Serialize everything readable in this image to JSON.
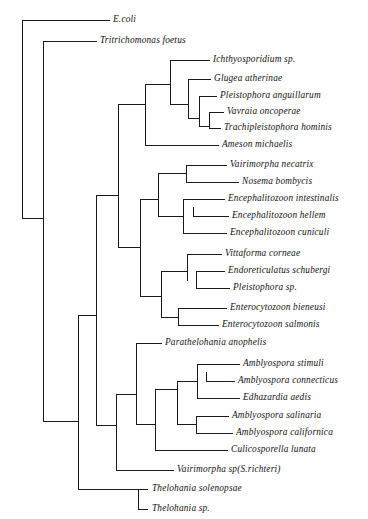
{
  "figure": {
    "kind": "phylogenetic-cladogram",
    "background_color": "#ffffff",
    "line_color": "#1a1a1a",
    "text_color": "#111111",
    "width": 368,
    "height": 519
  },
  "chart_data": {
    "type": "tree",
    "title": "",
    "xlabel": "",
    "ylabel": "",
    "leaf_count": 24,
    "leaves": [
      {
        "name": "E.coli",
        "x": 113,
        "y": 20
      },
      {
        "name": "Tritrichomonas foetus",
        "x": 100,
        "y": 41
      },
      {
        "name": "Ichthyosporidium sp.",
        "x": 213,
        "y": 60
      },
      {
        "name": "Glugea atherinae",
        "x": 214,
        "y": 79
      },
      {
        "name": "Pleistophora anguillarum",
        "x": 220,
        "y": 96
      },
      {
        "name": "Vavraia oncoperae",
        "x": 227,
        "y": 112
      },
      {
        "name": "Trachipleistophora hominis",
        "x": 224,
        "y": 128
      },
      {
        "name": "Ameson michaelis",
        "x": 222,
        "y": 145
      },
      {
        "name": "Vairimorpha necatrix",
        "x": 230,
        "y": 165
      },
      {
        "name": "Nosema bombycis",
        "x": 242,
        "y": 182
      },
      {
        "name": "Encephalitozoon intestinalis",
        "x": 228,
        "y": 199
      },
      {
        "name": "Encephalitozoon hellem",
        "x": 232,
        "y": 216
      },
      {
        "name": "Encephalitozoon cuniculi",
        "x": 230,
        "y": 233
      },
      {
        "name": "Vittaforma corneae",
        "x": 225,
        "y": 254
      },
      {
        "name": "Endoreticulatus schubergi",
        "x": 228,
        "y": 271
      },
      {
        "name": "Pleistophora sp.",
        "x": 233,
        "y": 288
      },
      {
        "name": "Enterocytozoon bieneusi",
        "x": 230,
        "y": 308
      },
      {
        "name": "Enterocytozoon salmonis",
        "x": 222,
        "y": 325
      },
      {
        "name": "Parathelohania anophelis",
        "x": 165,
        "y": 343
      },
      {
        "name": "Amblyospora stimuli",
        "x": 243,
        "y": 364
      },
      {
        "name": "Amblyospora connecticus",
        "x": 238,
        "y": 381
      },
      {
        "name": "Edhazardia aedis",
        "x": 243,
        "y": 398
      },
      {
        "name": "Amblyospora salinaria",
        "x": 232,
        "y": 416
      },
      {
        "name": "Amblyospora californica",
        "x": 236,
        "y": 433
      },
      {
        "name": "Culicosporella lunata",
        "x": 231,
        "y": 450
      },
      {
        "name": "Vairimorpha sp(S.richteri)",
        "x": 177,
        "y": 470
      },
      {
        "name": "Thelohania solenopsae",
        "x": 152,
        "y": 489
      },
      {
        "name": "Thelohania sp.",
        "x": 152,
        "y": 509
      }
    ],
    "branches": [
      {
        "id": "root-v",
        "type": "vertical",
        "x": 22,
        "y1": 20,
        "y2": 218
      },
      {
        "id": "ecoli-h",
        "type": "horizontal",
        "y": 20,
        "x1": 22,
        "x2": 110
      },
      {
        "id": "node2-v",
        "type": "vertical",
        "x": 43,
        "y1": 41,
        "y2": 421
      },
      {
        "id": "root-h",
        "type": "horizontal",
        "y": 218,
        "x1": 22,
        "x2": 43
      },
      {
        "id": "tritri-h",
        "type": "horizontal",
        "y": 41,
        "x1": 43,
        "x2": 97
      },
      {
        "id": "micro-h",
        "type": "horizontal",
        "y": 421,
        "x1": 43,
        "x2": 78
      },
      {
        "id": "microA-v",
        "type": "vertical",
        "x": 78,
        "y1": 315,
        "y2": 489
      },
      {
        "id": "cladeA-h",
        "type": "horizontal",
        "y": 315,
        "x1": 78,
        "x2": 96
      },
      {
        "id": "cladeA-v",
        "type": "vertical",
        "x": 96,
        "y1": 195,
        "y2": 425
      },
      {
        "id": "thel-h",
        "type": "horizontal",
        "y": 489,
        "x1": 78,
        "x2": 138
      },
      {
        "id": "thel-v",
        "type": "vertical",
        "x": 138,
        "y1": 489,
        "y2": 509
      },
      {
        "id": "thel1-h",
        "type": "horizontal",
        "y": 489,
        "x1": 138,
        "x2": 148
      },
      {
        "id": "thel2-h",
        "type": "horizontal",
        "y": 509,
        "x1": 138,
        "x2": 148
      },
      {
        "id": "upper-h",
        "type": "horizontal",
        "y": 195,
        "x1": 96,
        "x2": 118
      },
      {
        "id": "upper-v",
        "type": "vertical",
        "x": 118,
        "y1": 104,
        "y2": 247
      },
      {
        "id": "topclade-h",
        "type": "horizontal",
        "y": 104,
        "x1": 118,
        "x2": 145
      },
      {
        "id": "topclade-v",
        "type": "vertical",
        "x": 145,
        "y1": 84,
        "y2": 145
      },
      {
        "id": "ameson-h",
        "type": "horizontal",
        "y": 145,
        "x1": 145,
        "x2": 219
      },
      {
        "id": "ladder1-h",
        "type": "horizontal",
        "y": 84,
        "x1": 145,
        "x2": 170
      },
      {
        "id": "ladder1-v",
        "type": "vertical",
        "x": 170,
        "y1": 60,
        "y2": 104
      },
      {
        "id": "ichthyo-h",
        "type": "horizontal",
        "y": 60,
        "x1": 170,
        "x2": 210
      },
      {
        "id": "ladder2-h",
        "type": "horizontal",
        "y": 104,
        "x1": 170,
        "x2": 188
      },
      {
        "id": "ladder2-v",
        "type": "vertical",
        "x": 188,
        "y1": 79,
        "y2": 118
      },
      {
        "id": "glugea-h",
        "type": "horizontal",
        "y": 79,
        "x1": 188,
        "x2": 211
      },
      {
        "id": "ladder3-h",
        "type": "horizontal",
        "y": 118,
        "x1": 188,
        "x2": 199
      },
      {
        "id": "ladder3-v",
        "type": "vertical",
        "x": 199,
        "y1": 96,
        "y2": 126
      },
      {
        "id": "pleisang-h",
        "type": "horizontal",
        "y": 96,
        "x1": 199,
        "x2": 217
      },
      {
        "id": "ladder4-h",
        "type": "horizontal",
        "y": 126,
        "x1": 199,
        "x2": 209
      },
      {
        "id": "ladder4-v",
        "type": "vertical",
        "x": 209,
        "y1": 112,
        "y2": 128
      },
      {
        "id": "vavraia-h",
        "type": "horizontal",
        "y": 112,
        "x1": 209,
        "x2": 224
      },
      {
        "id": "trachi-h",
        "type": "horizontal",
        "y": 128,
        "x1": 209,
        "x2": 221
      },
      {
        "id": "mid-h",
        "type": "horizontal",
        "y": 247,
        "x1": 118,
        "x2": 140
      },
      {
        "id": "mid-v",
        "type": "vertical",
        "x": 140,
        "y1": 199,
        "y2": 296
      },
      {
        "id": "encnos-h",
        "type": "horizontal",
        "y": 199,
        "x1": 140,
        "x2": 158
      },
      {
        "id": "encnos-v",
        "type": "vertical",
        "x": 158,
        "y1": 173,
        "y2": 216
      },
      {
        "id": "vairnos-h",
        "type": "horizontal",
        "y": 173,
        "x1": 158,
        "x2": 186
      },
      {
        "id": "vairnos-v",
        "type": "vertical",
        "x": 186,
        "y1": 165,
        "y2": 182
      },
      {
        "id": "vairnec-h",
        "type": "horizontal",
        "y": 165,
        "x1": 186,
        "x2": 227
      },
      {
        "id": "nosema-h",
        "type": "horizontal",
        "y": 182,
        "x1": 186,
        "x2": 239
      },
      {
        "id": "enceph-h",
        "type": "horizontal",
        "y": 216,
        "x1": 158,
        "x2": 183
      },
      {
        "id": "enceph-v",
        "type": "vertical",
        "x": 183,
        "y1": 199,
        "y2": 233
      },
      {
        "id": "encint-h",
        "type": "horizontal",
        "y": 199,
        "x1": 183,
        "x2": 225
      },
      {
        "id": "enchel-v",
        "type": "vertical",
        "x": 193,
        "y1": 207,
        "y2": 216
      },
      {
        "id": "enchel-h",
        "type": "horizontal",
        "y": 216,
        "x1": 193,
        "x2": 229
      },
      {
        "id": "enccun-h",
        "type": "horizontal",
        "y": 233,
        "x1": 183,
        "x2": 227
      },
      {
        "id": "vitent-h",
        "type": "horizontal",
        "y": 296,
        "x1": 140,
        "x2": 161
      },
      {
        "id": "vitent-v",
        "type": "vertical",
        "x": 161,
        "y1": 271,
        "y2": 317
      },
      {
        "id": "vitta-h",
        "type": "horizontal",
        "y": 271,
        "x1": 161,
        "x2": 187
      },
      {
        "id": "vitta-v",
        "type": "vertical",
        "x": 187,
        "y1": 254,
        "y2": 281
      },
      {
        "id": "vittacor-h",
        "type": "horizontal",
        "y": 254,
        "x1": 187,
        "x2": 222
      },
      {
        "id": "endo-v",
        "type": "vertical",
        "x": 196,
        "y1": 271,
        "y2": 288
      },
      {
        "id": "endo-h",
        "type": "horizontal",
        "y": 271,
        "x1": 196,
        "x2": 225
      },
      {
        "id": "pleisp-h",
        "type": "horizontal",
        "y": 288,
        "x1": 196,
        "x2": 230
      },
      {
        "id": "entero-h",
        "type": "horizontal",
        "y": 317,
        "x1": 161,
        "x2": 178
      },
      {
        "id": "entero-v",
        "type": "vertical",
        "x": 178,
        "y1": 308,
        "y2": 325
      },
      {
        "id": "enterobi-h",
        "type": "horizontal",
        "y": 308,
        "x1": 178,
        "x2": 227
      },
      {
        "id": "enterosal-h",
        "type": "horizontal",
        "y": 325,
        "x1": 178,
        "x2": 219
      },
      {
        "id": "lower-h",
        "type": "horizontal",
        "y": 425,
        "x1": 96,
        "x2": 116
      },
      {
        "id": "lower-v",
        "type": "vertical",
        "x": 116,
        "y1": 394,
        "y2": 470
      },
      {
        "id": "vairsp-h",
        "type": "horizontal",
        "y": 470,
        "x1": 116,
        "x2": 174
      },
      {
        "id": "amb-h",
        "type": "horizontal",
        "y": 394,
        "x1": 116,
        "x2": 136
      },
      {
        "id": "amb-v",
        "type": "vertical",
        "x": 136,
        "y1": 343,
        "y2": 424
      },
      {
        "id": "parath-h",
        "type": "horizontal",
        "y": 343,
        "x1": 136,
        "x2": 162
      },
      {
        "id": "amb2-h",
        "type": "horizontal",
        "y": 424,
        "x1": 136,
        "x2": 155
      },
      {
        "id": "amb2-v",
        "type": "vertical",
        "x": 155,
        "y1": 389,
        "y2": 450
      },
      {
        "id": "culico-h",
        "type": "horizontal",
        "y": 450,
        "x1": 155,
        "x2": 228
      },
      {
        "id": "amb3-h",
        "type": "horizontal",
        "y": 389,
        "x1": 155,
        "x2": 177
      },
      {
        "id": "amb3-v",
        "type": "vertical",
        "x": 177,
        "y1": 381,
        "y2": 424
      },
      {
        "id": "amb4-h",
        "type": "horizontal",
        "y": 381,
        "x1": 177,
        "x2": 197
      },
      {
        "id": "amb4-v",
        "type": "vertical",
        "x": 197,
        "y1": 364,
        "y2": 398
      },
      {
        "id": "stimuli-h",
        "type": "horizontal",
        "y": 364,
        "x1": 197,
        "x2": 240
      },
      {
        "id": "connect-v",
        "type": "vertical",
        "x": 206,
        "y1": 372,
        "y2": 381
      },
      {
        "id": "connect-h",
        "type": "horizontal",
        "y": 381,
        "x1": 206,
        "x2": 235
      },
      {
        "id": "edha-h",
        "type": "horizontal",
        "y": 398,
        "x1": 197,
        "x2": 240
      },
      {
        "id": "salcal-h",
        "type": "horizontal",
        "y": 424,
        "x1": 177,
        "x2": 196
      },
      {
        "id": "salcal-v",
        "type": "vertical",
        "x": 196,
        "y1": 416,
        "y2": 433
      },
      {
        "id": "salinaria-h",
        "type": "horizontal",
        "y": 416,
        "x1": 196,
        "x2": 229
      },
      {
        "id": "californica-h",
        "type": "horizontal",
        "y": 433,
        "x1": 196,
        "x2": 233
      }
    ]
  }
}
